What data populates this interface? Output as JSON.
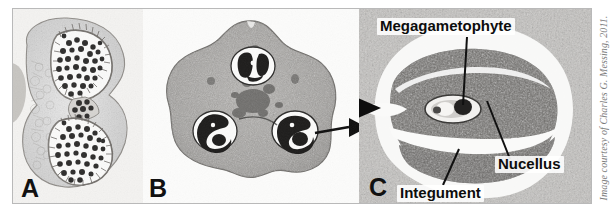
{
  "figure": {
    "background_color": "#ffffff",
    "frame_color": "#b9b9b9",
    "label_text_color": "#0d0d0d"
  },
  "panels": [
    {
      "id": "A",
      "letter": "A",
      "caption": "Cross section of anther showing two pollen sacs filled with dark pollen grains",
      "subject": "anther-cross-section"
    },
    {
      "id": "B",
      "letter": "B",
      "caption": "Triangular ovary cross section with three ovules",
      "subject": "ovary-cross-section"
    },
    {
      "id": "C",
      "letter": "C",
      "caption": "Magnified single ovule showing megagametophyte, nucellus and integument",
      "subject": "ovule-detail"
    }
  ],
  "callouts": [
    {
      "name": "megagametophyte",
      "label": "Megagametophyte"
    },
    {
      "name": "nucellus",
      "label": "Nucellus"
    },
    {
      "name": "integument",
      "label": "Integument"
    }
  ],
  "arrow": {
    "name": "b-to-c-arrow",
    "description": "Arrow pointing from ovule in panel B to magnified panel C"
  },
  "credit": {
    "text": "Image courtesy of Charles G. Messing, 2011.",
    "color": "#7d7d7d"
  }
}
